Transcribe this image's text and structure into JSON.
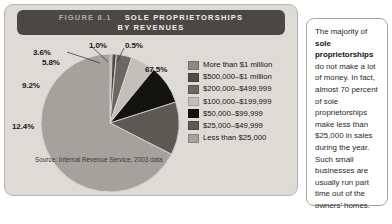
{
  "figure": {
    "number_label": "FIGURE 8.1",
    "title_line1": "SOLE PROPRIETORSHIPS",
    "title_line2": "BY REVENUES",
    "source": "Source: Internal Revenue Service, 2003 data"
  },
  "colors": {
    "banner": "#4a4744",
    "card_bg": "#dedbd6",
    "panel_bg": "#ffffff",
    "label_text": "#1b1a19"
  },
  "chart_data": {
    "type": "pie",
    "title": "Sole Proprietorships by Revenues",
    "xlabel": "",
    "ylabel": "",
    "source": "Internal Revenue Service, 2003 data",
    "legend_position": "right",
    "categories": [
      "More than $1 million",
      "$500,000–$1 million",
      "$200,000–$499,999",
      "$100,000–$199,999",
      "$50,000–$99,999",
      "$25,000–$49,999",
      "Less than $25,000"
    ],
    "values": [
      0.5,
      1.0,
      3.6,
      5.8,
      9.2,
      12.4,
      67.5
    ],
    "value_labels": [
      "0.5%",
      "1.0%",
      "3.6%",
      "5.8%",
      "9.2%",
      "12.4%",
      "67.5%"
    ],
    "slice_colors": [
      "#8d8a85",
      "#4e4c49",
      "#6b6864",
      "#c3c0bb",
      "#131312",
      "#5c5955",
      "#a5a29d"
    ]
  },
  "legend": {
    "items": [
      {
        "label": "More than $1 million",
        "color": "#8d8a85"
      },
      {
        "label": "$500,000–$1 million",
        "color": "#4e4c49"
      },
      {
        "label": "$200,000–$499,999",
        "color": "#6b6864"
      },
      {
        "label": "$100,000–$199,999",
        "color": "#c3c0bb"
      },
      {
        "label": "$50,000–$99,999",
        "color": "#131312"
      },
      {
        "label": "$25,000–$49,999",
        "color": "#5c5955"
      },
      {
        "label": "Less than $25,000",
        "color": "#a5a29d"
      }
    ]
  },
  "side_panel": {
    "paragraph_part1": "The majority of ",
    "paragraph_bold": "sole proprietorships",
    "paragraph_part2": " do not make a lot of money. In fact, almost 70 percent of sole proprietorships make less than $25,000 in sales during the year. Such small businesses are usually run part time out of the owners’ homes."
  }
}
